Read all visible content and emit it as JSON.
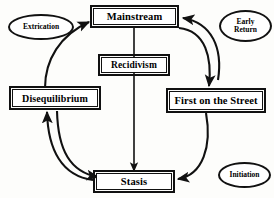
{
  "diagram": {
    "background_color": "#fdfdfb",
    "line_color": "#111111",
    "text_color": "#000000",
    "nodes": {
      "mainstream": {
        "label": "Mainstream",
        "shape": "rectangle"
      },
      "recidivism": {
        "label": "Recidivism",
        "shape": "rectangle"
      },
      "disequilibrium": {
        "label": "Disequilibrium",
        "shape": "rectangle"
      },
      "first_on_the_street": {
        "label": "First on the Street",
        "shape": "rectangle"
      },
      "stasis": {
        "label": "Stasis",
        "shape": "rectangle"
      },
      "extrication": {
        "label": "Extrication",
        "shape": "ellipse"
      },
      "early_return": {
        "label_line1": "Early",
        "label_line2": "Return",
        "shape": "ellipse"
      },
      "initiation": {
        "label": "Initiation",
        "shape": "ellipse"
      }
    },
    "edges": [
      {
        "from": "mainstream",
        "to": "stasis",
        "style": "straight-down",
        "label": ""
      },
      {
        "from": "mainstream",
        "to": "first_on_the_street",
        "style": "curve-right-down",
        "label": ""
      },
      {
        "from": "first_on_the_street",
        "to": "mainstream",
        "style": "curve-right-up",
        "label": ""
      },
      {
        "from": "first_on_the_street",
        "to": "stasis",
        "style": "curve-down-left",
        "label": ""
      },
      {
        "from": "stasis",
        "to": "disequilibrium",
        "style": "curve-left-up",
        "label": ""
      },
      {
        "from": "disequilibrium",
        "to": "stasis",
        "style": "curve-left-down",
        "label": ""
      },
      {
        "from": "disequilibrium",
        "to": "mainstream",
        "style": "curve-up-right",
        "label": ""
      }
    ],
    "edge_labels": {
      "extrication": "Extrication",
      "early_return": "Early Return",
      "initiation": "Initiation"
    }
  }
}
